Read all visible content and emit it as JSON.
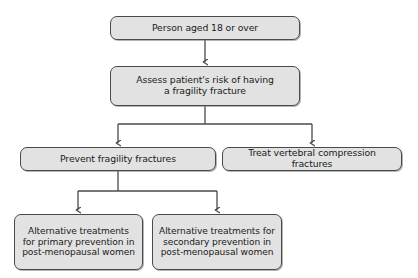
{
  "diagram": {
    "type": "flowchart",
    "style": {
      "node_fill": "#e2e2e2",
      "node_border": "#4a4a4a",
      "connector_color": "#4a4a4a",
      "background": "#ffffff",
      "text_color": "#1a1a1a"
    },
    "nodes": [
      {
        "id": "person",
        "label": "Person aged 18 or over",
        "lines": [
          "Person aged 18 or over"
        ],
        "row": 1
      },
      {
        "id": "assess",
        "label": "Assess patient's risk of having a fragility fracture",
        "lines": [
          "Assess patient's risk of having",
          "a fragility fracture"
        ],
        "row": 2
      },
      {
        "id": "prevent",
        "label": "Prevent fragility fractures",
        "lines": [
          "Prevent fragility fractures"
        ],
        "row": 3
      },
      {
        "id": "treat",
        "label": "Treat vertebral compression fractures",
        "lines": [
          "Treat vertebral compression fractures"
        ],
        "row": 3
      },
      {
        "id": "primary",
        "label": "Alternative treatments for primary prevention in post-menopausal women",
        "lines": [
          "Alternative treatments",
          "for primary prevention in",
          "post-menopausal women"
        ],
        "row": 4
      },
      {
        "id": "secondary",
        "label": "Alternative treatments for secondary prevention in post-menopausal women",
        "lines": [
          "Alternative treatments for",
          "secondary prevention in",
          "post-menopausal women"
        ],
        "row": 4
      }
    ],
    "edges": [
      {
        "from": "person",
        "to": "assess",
        "kind": "straight-arrow"
      },
      {
        "from": "assess",
        "to": "prevent",
        "kind": "split-arrow"
      },
      {
        "from": "assess",
        "to": "treat",
        "kind": "split-arrow"
      },
      {
        "from": "prevent",
        "to": "primary",
        "kind": "split-arrow"
      },
      {
        "from": "prevent",
        "to": "secondary",
        "kind": "split-arrow"
      }
    ]
  }
}
